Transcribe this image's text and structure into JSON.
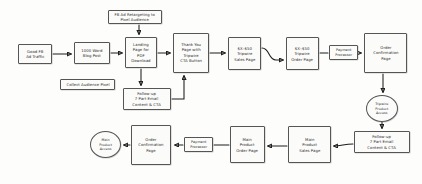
{
  "diagram": {
    "background_color": "#fdfdfc",
    "node_fill": "#fbfbfa",
    "node_stroke": "#555555",
    "edge_color": "#1d1d1d",
    "text_color": "#2b2b2b"
  },
  "nodes": [
    {
      "id": "fb_ad_traffic",
      "label": "Good FB\nAd Traffic",
      "shape": "rect",
      "x": 18,
      "y": 44,
      "w": 34,
      "h": 20
    },
    {
      "id": "blog_post",
      "label": "1000 Word\nBlog Post",
      "shape": "rect",
      "x": 74,
      "y": 42,
      "w": 36,
      "h": 22
    },
    {
      "id": "collect_pixel",
      "label": "Collect Audience Pixel",
      "shape": "rect",
      "x": 60,
      "y": 79,
      "w": 55,
      "h": 11
    },
    {
      "id": "fb_retargeting",
      "label": "FB Ad Retargeting to\nPixel Audience",
      "shape": "rect",
      "x": 108,
      "y": 10,
      "w": 54,
      "h": 14
    },
    {
      "id": "landing_page",
      "label": "Landing\nPage for\nPDF\nDownload",
      "shape": "rect",
      "x": 125,
      "y": 37,
      "w": 32,
      "h": 31
    },
    {
      "id": "thank_you_page",
      "label": "Thank You\nPage with\nTripwire\nCTA Button",
      "shape": "rect",
      "x": 173,
      "y": 33,
      "w": 36,
      "h": 40
    },
    {
      "id": "tripwire_sales",
      "label": "$X–$50\nTripwire\nSales Page",
      "shape": "rect",
      "x": 228,
      "y": 37,
      "w": 33,
      "h": 33
    },
    {
      "id": "tripwire_order",
      "label": "$X–$50\nTripwire\nOrder Page",
      "shape": "rect",
      "x": 286,
      "y": 37,
      "w": 33,
      "h": 33
    },
    {
      "id": "payment_top",
      "label": "Payment\nProcessor",
      "shape": "rect",
      "x": 329,
      "y": 45,
      "w": 29,
      "h": 15
    },
    {
      "id": "order_conf_top",
      "label": "Order\nConfirmation\nPage",
      "shape": "rect",
      "x": 364,
      "y": 33,
      "w": 43,
      "h": 40
    },
    {
      "id": "tripwire_access",
      "label": "Tripwire\nProduct\nAccess",
      "shape": "oval",
      "x": 366,
      "y": 95,
      "w": 32,
      "h": 27
    },
    {
      "id": "followup_email_right",
      "label": "Follow-up\n7 Part Email\nContent & CTA",
      "shape": "rect",
      "x": 354,
      "y": 131,
      "w": 56,
      "h": 22
    },
    {
      "id": "followup_email_mid",
      "label": "Follow-up\n7 Part Email\nContent & CTA",
      "shape": "rect",
      "x": 123,
      "y": 88,
      "w": 48,
      "h": 22
    },
    {
      "id": "main_sales",
      "label": "Main\nProduct\nSales Page",
      "shape": "rect",
      "x": 288,
      "y": 126,
      "w": 43,
      "h": 37
    },
    {
      "id": "main_order",
      "label": "Main\nProduct\nOrder Page",
      "shape": "rect",
      "x": 230,
      "y": 126,
      "w": 35,
      "h": 37
    },
    {
      "id": "payment_bottom",
      "label": "Payment\nProcessor",
      "shape": "rect",
      "x": 184,
      "y": 137,
      "w": 29,
      "h": 15
    },
    {
      "id": "order_conf_bottom",
      "label": "Order\nConfirmation\nPage",
      "shape": "rect",
      "x": 131,
      "y": 125,
      "w": 40,
      "h": 40
    },
    {
      "id": "main_access",
      "label": "Main\nProduct\nAccess",
      "shape": "oval",
      "x": 90,
      "y": 131,
      "w": 31,
      "h": 27
    }
  ],
  "edges": [
    {
      "id": "e1",
      "from": "fb_ad_traffic",
      "to": "blog_post",
      "type": "arrow"
    },
    {
      "id": "e2",
      "from": "blog_post",
      "to": "landing_page",
      "type": "arrow"
    },
    {
      "id": "e3",
      "from": "fb_retargeting",
      "to": "landing_page",
      "type": "arrow"
    },
    {
      "id": "e4",
      "from": "landing_page",
      "to": "thank_you_page",
      "type": "arrow"
    },
    {
      "id": "e5",
      "from": "thank_you_page",
      "to": "tripwire_sales",
      "type": "arrow"
    },
    {
      "id": "e6",
      "from": "tripwire_sales",
      "to": "tripwire_order",
      "type": "arrow"
    },
    {
      "id": "e7",
      "from": "tripwire_order",
      "to": "payment_top",
      "type": "line"
    },
    {
      "id": "e8",
      "from": "payment_top",
      "to": "order_conf_top",
      "type": "arrow"
    },
    {
      "id": "e9",
      "from": "order_conf_top",
      "to": "tripwire_access",
      "type": "arrow"
    },
    {
      "id": "e10",
      "from": "tripwire_access",
      "to": "followup_email_right",
      "type": "arrow"
    },
    {
      "id": "e11",
      "from": "followup_email_right",
      "to": "main_sales",
      "type": "arrow"
    },
    {
      "id": "e12",
      "from": "main_sales",
      "to": "main_order",
      "type": "arrow"
    },
    {
      "id": "e13",
      "from": "main_order",
      "to": "payment_bottom",
      "type": "line"
    },
    {
      "id": "e14",
      "from": "payment_bottom",
      "to": "order_conf_bottom",
      "type": "arrow"
    },
    {
      "id": "e15",
      "from": "order_conf_bottom",
      "to": "main_access",
      "type": "arrow"
    },
    {
      "id": "e16",
      "from": "landing_page",
      "to": "followup_email_mid",
      "type": "arrow"
    },
    {
      "id": "e17",
      "from": "followup_email_mid",
      "to": "thank_you_page",
      "type": "arrow"
    }
  ]
}
